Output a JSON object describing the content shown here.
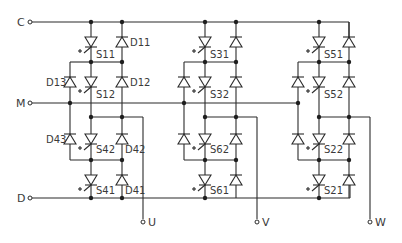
{
  "diagram": {
    "type": "three-level NPC inverter circuit",
    "terminals": {
      "C": "C",
      "M": "M",
      "D": "D",
      "U": "U",
      "V": "V",
      "W": "W"
    },
    "phase_u": {
      "switches": [
        "S11",
        "S12",
        "S42",
        "S41"
      ],
      "diodes": [
        "D11",
        "D12",
        "D13",
        "D43",
        "D42",
        "D41"
      ]
    },
    "phase_v": {
      "switches": [
        "S31",
        "S32",
        "S62",
        "S61"
      ]
    },
    "phase_w": {
      "switches": [
        "S51",
        "S52",
        "S22",
        "S21"
      ]
    }
  }
}
